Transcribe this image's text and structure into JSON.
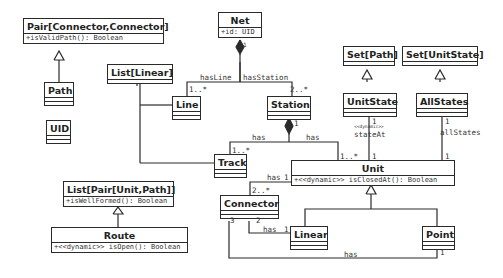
{
  "diagram": {
    "type": "UML class diagram",
    "classes": {
      "pair_connector": {
        "name": "Pair[Connector,Connector]",
        "ops": [
          "+isValidPath(): Boolean"
        ]
      },
      "path": {
        "name": "Path"
      },
      "uid": {
        "name": "UID"
      },
      "net": {
        "name": "Net",
        "attrs": [
          "+id: UID"
        ]
      },
      "list_linear": {
        "name": "List[Linear]"
      },
      "line": {
        "name": "Line"
      },
      "station": {
        "name": "Station"
      },
      "set_path": {
        "name": "Set[Path]"
      },
      "set_unitstate": {
        "name": "Set[UnitState]"
      },
      "unitstate": {
        "name": "UnitState"
      },
      "allstates": {
        "name": "AllStates"
      },
      "track": {
        "name": "Track"
      },
      "unit": {
        "name": "Unit",
        "ops": [
          "+<<dynamic>> isClosedAt(): Boolean"
        ]
      },
      "list_pair": {
        "name": "List[Pair[Unit,Path]]",
        "ops": [
          "+isWellFormed(): Boolean"
        ]
      },
      "route": {
        "name": "Route",
        "ops": [
          "+<<dynamic>> isOpen(): Boolean"
        ]
      },
      "connector": {
        "name": "Connector"
      },
      "linear": {
        "name": "Linear"
      },
      "point": {
        "name": "Point"
      }
    },
    "labels": {
      "net_one": "1",
      "has_line": "hasLine",
      "has_station": "hasStation",
      "line_mult": "1..*",
      "station_mult": "2..*",
      "station_one": "1",
      "station_track_has": "has",
      "station_unit_has": "has",
      "track_mult": "1..*",
      "unit_station_mult": "1..*",
      "unitstate_one": "1",
      "state_at_stereo": "<<dynamic>>",
      "state_at": "stateAt",
      "unit_state_one": "1",
      "allstates_one": "1",
      "all_states": "allStates",
      "unit_allstates_one": "1",
      "unit_connector_has": "has",
      "unit_connector_one": "1",
      "connector_mult": "2..*",
      "connector_three": "3",
      "connector_two": "2",
      "linear_has": "has",
      "linear_one": "1",
      "point_has": "has",
      "point_one": "1"
    }
  }
}
